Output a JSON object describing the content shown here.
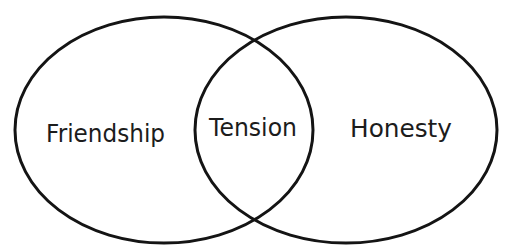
{
  "diagram": {
    "type": "venn",
    "sets": [
      {
        "label": "Friendship",
        "region": "left"
      },
      {
        "label": "Honesty",
        "region": "right"
      }
    ],
    "intersection": {
      "label": "Tension"
    },
    "colors": {
      "stroke": "#141414",
      "text": "#1c1c1c",
      "background": "#ffffff"
    }
  }
}
